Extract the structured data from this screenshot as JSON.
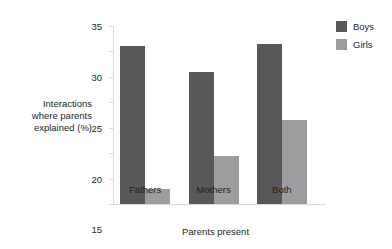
{
  "chart_data": {
    "type": "bar",
    "title": "",
    "categories": [
      "Fathers",
      "Mothers",
      "Both"
    ],
    "series": [
      {
        "name": "Boys",
        "color": "#58585a",
        "values": [
          31,
          26,
          31.5
        ]
      },
      {
        "name": "Girls",
        "color": "#9d9d9f",
        "values": [
          3,
          9.5,
          16.5
        ]
      }
    ],
    "xlabel": "Parents present",
    "ylabel": "Interactions where parents explained (%)",
    "ylabel_lines": [
      "Interactions",
      "where parents",
      "explained (%)"
    ],
    "ylim": [
      0,
      35
    ],
    "yticks": [
      0,
      5,
      10,
      15,
      20,
      25,
      30,
      35
    ],
    "ytick_labels": [
      "0",
      "5",
      "10",
      "15",
      "20",
      "25",
      "30",
      "35"
    ],
    "grid": false,
    "legend_position": "top-right",
    "legend": [
      "Boys",
      "Girls"
    ]
  }
}
